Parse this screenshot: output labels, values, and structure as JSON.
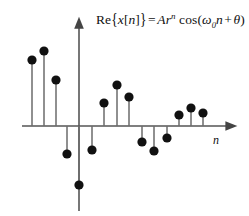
{
  "figure": {
    "title_equation": "Re{x[n]} = Ar^n cos(ω₀n + θ)",
    "equation_parts": {
      "re": "Re",
      "brace_open": "{",
      "x_sym": "x",
      "bracket_open": "[",
      "n_index": "n",
      "bracket_close": "]",
      "brace_close": "}",
      "equals": "=",
      "amplitude": "A",
      "ratio": "r",
      "exponent": "n",
      "cos": "cos",
      "paren_open": "(",
      "omega": "ω",
      "omega_sub": "0",
      "n_var": "n",
      "plus": "+",
      "theta": "θ",
      "paren_close": ")"
    },
    "x_axis_label": "n",
    "colors": {
      "stem": "#6b6b6b",
      "marker": "#111111",
      "axis": "#555555",
      "text": "#111111",
      "background": "#ffffff"
    }
  },
  "chart_data": {
    "type": "stem",
    "xlabel": "n",
    "ylabel": "",
    "grid": false,
    "legend": null,
    "origin_px": {
      "x": 79,
      "y": 126
    },
    "axis_ranges": {
      "x_px": [
        22,
        232
      ],
      "y_px": [
        22,
        211
      ]
    },
    "x": [
      -4,
      -3,
      -2,
      -1,
      0,
      1,
      2,
      3,
      4,
      5,
      6,
      7,
      8,
      9,
      10,
      11,
      12
    ],
    "values_px": [
      66,
      75,
      46,
      -28,
      -59,
      -24,
      23,
      41,
      29,
      -16,
      -25,
      -12,
      11,
      18,
      13,
      0,
      0
    ],
    "points": [
      {
        "n": -4,
        "x_px": 32,
        "y_px": 60,
        "value_px": 66
      },
      {
        "n": -3,
        "x_px": 44,
        "y_px": 51,
        "value_px": 75
      },
      {
        "n": -2,
        "x_px": 56,
        "y_px": 80,
        "value_px": 46
      },
      {
        "n": -1,
        "x_px": 67,
        "y_px": 154,
        "value_px": -28
      },
      {
        "n": 0,
        "x_px": 79,
        "y_px": 185,
        "value_px": -59
      },
      {
        "n": 1,
        "x_px": 92,
        "y_px": 150,
        "value_px": -24
      },
      {
        "n": 2,
        "x_px": 104,
        "y_px": 103,
        "value_px": 23
      },
      {
        "n": 3,
        "x_px": 117,
        "y_px": 85,
        "value_px": 41
      },
      {
        "n": 4,
        "x_px": 129,
        "y_px": 97,
        "value_px": 29
      },
      {
        "n": 5,
        "x_px": 142,
        "y_px": 142,
        "value_px": -16
      },
      {
        "n": 6,
        "x_px": 154,
        "y_px": 151,
        "value_px": -25
      },
      {
        "n": 7,
        "x_px": 167,
        "y_px": 138,
        "value_px": -12
      },
      {
        "n": 8,
        "x_px": 179,
        "y_px": 115,
        "value_px": 11
      },
      {
        "n": 9,
        "x_px": 191,
        "y_px": 108,
        "value_px": 18
      },
      {
        "n": 10,
        "x_px": 203,
        "y_px": 113,
        "value_px": 13
      }
    ]
  }
}
